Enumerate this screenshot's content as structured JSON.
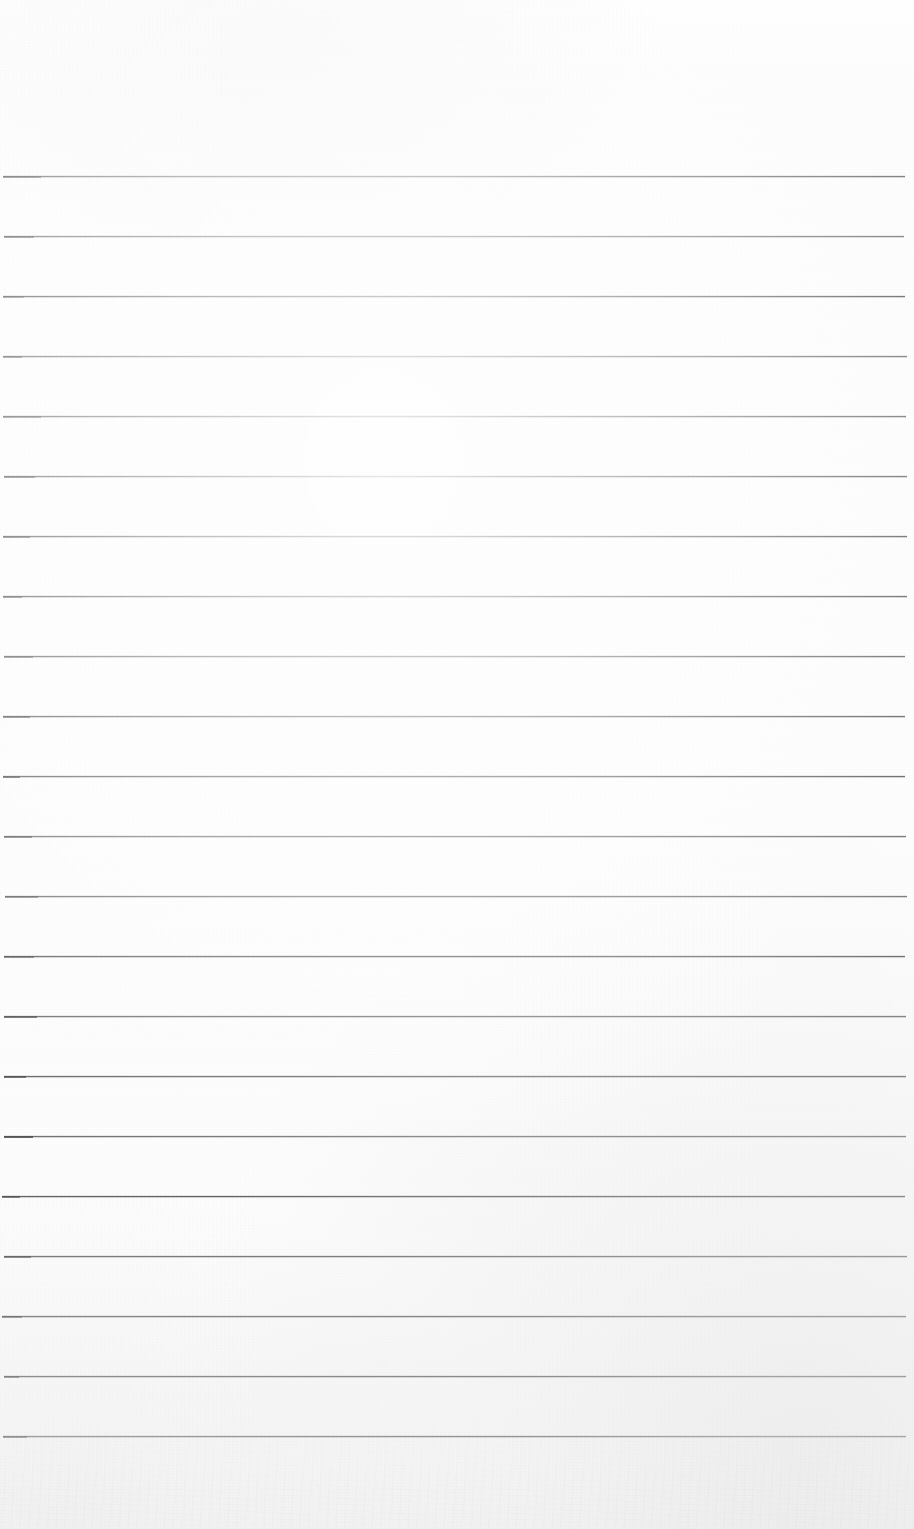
{
  "document": {
    "kind": "scanned-ruled-paper",
    "title": "Blank Ruled Notebook Page",
    "page_width": 914,
    "page_height": 1529,
    "content_text": "",
    "has_handwriting": false,
    "has_printed_text": false,
    "background_color": "#fdfdfd",
    "paper_tint": "#fcfcfc"
  },
  "ruling": {
    "line_color": "#5c5c5c",
    "line_thickness_px": 1,
    "line_count": 22,
    "first_line_y": 176,
    "line_spacing_px": 60,
    "left_x": 3,
    "right_x": 906,
    "top_margin_px": 176,
    "bottom_margin_px": 93,
    "left_margin_px": 3,
    "right_margin_px": 8,
    "lines_y": [
      176,
      236,
      296,
      356,
      416,
      476,
      536,
      596,
      656,
      716,
      776,
      836,
      896,
      956,
      1016,
      1076,
      1136,
      1196,
      1256,
      1316,
      1376,
      1436
    ]
  },
  "scan": {
    "vignette_color": "#e4e4e4",
    "highlight_color": "#ffffff",
    "grain_opacity": 0.5
  }
}
